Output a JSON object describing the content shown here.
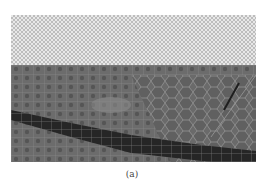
{
  "figure": {
    "caption": "(a)",
    "colors": {
      "sky_checker_light": "#e8e8e8",
      "sky_checker_dark": "#bdbdbd",
      "ground": "#6e6e6e",
      "road_band": "#262626",
      "superpixel_edges": "#9a9a9a"
    }
  }
}
